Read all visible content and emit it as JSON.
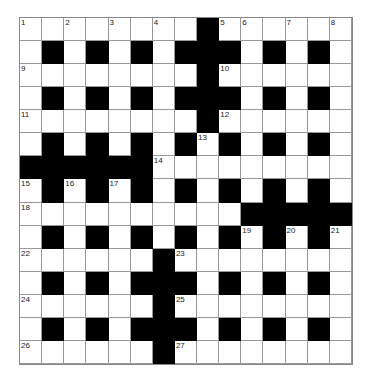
{
  "puzzle": {
    "rows": 15,
    "cols": 15,
    "colors": {
      "block": "#000000",
      "cell": "#ffffff",
      "line": "#999999"
    },
    "layout": [
      "........#......",
      ".#.#.#.###.#.#.",
      "........#......",
      ".#.#.#.###.#.#.",
      "........#......",
      ".#.#.#.#.#.#.#.",
      "######.........",
      ".#.#.#.#.#.#.#.",
      "..........#####",
      ".#.#.#.#.#.#.#.",
      "......#........",
      ".#.#.###.#.#.#.",
      "......#........",
      ".#.#.###.#.#.#.",
      "......#........"
    ],
    "numbers": [
      {
        "n": "1",
        "r": 0,
        "c": 0
      },
      {
        "n": "2",
        "r": 0,
        "c": 2
      },
      {
        "n": "3",
        "r": 0,
        "c": 4
      },
      {
        "n": "4",
        "r": 0,
        "c": 6
      },
      {
        "n": "5",
        "r": 0,
        "c": 9
      },
      {
        "n": "6",
        "r": 0,
        "c": 10
      },
      {
        "n": "7",
        "r": 0,
        "c": 12
      },
      {
        "n": "8",
        "r": 0,
        "c": 14
      },
      {
        "n": "9",
        "r": 2,
        "c": 0
      },
      {
        "n": "10",
        "r": 2,
        "c": 9
      },
      {
        "n": "11",
        "r": 4,
        "c": 0
      },
      {
        "n": "12",
        "r": 4,
        "c": 9
      },
      {
        "n": "13",
        "r": 5,
        "c": 8
      },
      {
        "n": "14",
        "r": 6,
        "c": 6
      },
      {
        "n": "15",
        "r": 7,
        "c": 0
      },
      {
        "n": "16",
        "r": 7,
        "c": 2
      },
      {
        "n": "17",
        "r": 7,
        "c": 4
      },
      {
        "n": "18",
        "r": 8,
        "c": 0
      },
      {
        "n": "19",
        "r": 9,
        "c": 10
      },
      {
        "n": "20",
        "r": 9,
        "c": 12
      },
      {
        "n": "21",
        "r": 9,
        "c": 14
      },
      {
        "n": "22",
        "r": 10,
        "c": 0
      },
      {
        "n": "23",
        "r": 10,
        "c": 7
      },
      {
        "n": "24",
        "r": 12,
        "c": 0
      },
      {
        "n": "25",
        "r": 12,
        "c": 7
      },
      {
        "n": "26",
        "r": 14,
        "c": 0
      },
      {
        "n": "27",
        "r": 14,
        "c": 7
      }
    ]
  }
}
